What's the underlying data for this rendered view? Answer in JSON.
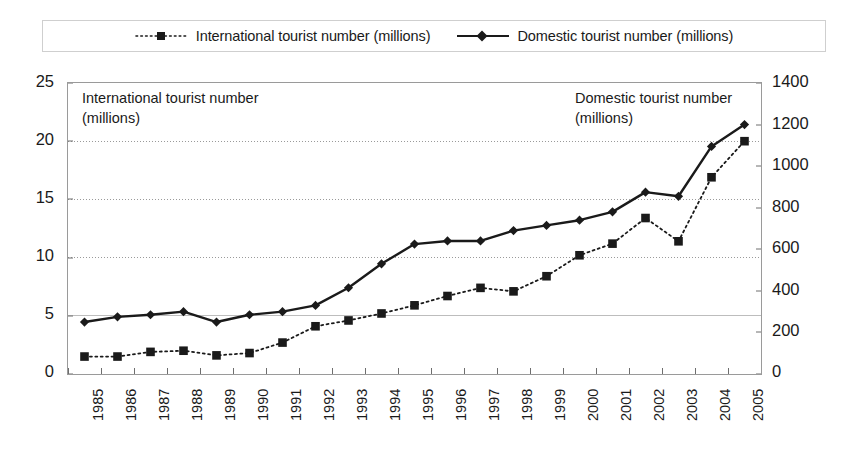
{
  "legend": {
    "entries": [
      {
        "label": "International tourist number (millions)",
        "marker": "square-marker",
        "line": "dotted",
        "color": "#1a1a1a"
      },
      {
        "label": "Domestic tourist number (millions)",
        "marker": "diamond-marker",
        "line": "solid",
        "color": "#1a1a1a"
      }
    ]
  },
  "annotations": {
    "international": "International tourist number\n(millions)",
    "domestic": "Domestic tourist number\n(millions)"
  },
  "axes": {
    "left_ticks": [
      "25",
      "20",
      "15",
      "10",
      "5",
      "0"
    ],
    "right_ticks": [
      "1400",
      "1200",
      "1000",
      "800",
      "600",
      "400",
      "200",
      "0"
    ]
  },
  "chart_data": {
    "type": "line",
    "title": "",
    "xlabel": "",
    "ylabel": "",
    "y2label": "",
    "grid": true,
    "legend_position": "top",
    "categories": [
      "1985",
      "1986",
      "1987",
      "1988",
      "1989",
      "1990",
      "1991",
      "1992",
      "1993",
      "1994",
      "1995",
      "1996",
      "1997",
      "1998",
      "1999",
      "2000",
      "2001",
      "2002",
      "2003",
      "2004",
      "2005"
    ],
    "ylim": [
      0,
      25
    ],
    "yticks": [
      0,
      5,
      10,
      15,
      20,
      25
    ],
    "y2lim": [
      0,
      1400
    ],
    "y2ticks": [
      0,
      200,
      400,
      600,
      800,
      1000,
      1200,
      1400
    ],
    "series": [
      {
        "name": "International tourist number (millions)",
        "axis": "left",
        "marker": "square",
        "linestyle": "dotted",
        "color": "#1a1a1a",
        "values": [
          1.5,
          1.5,
          1.9,
          2.0,
          1.6,
          1.8,
          2.7,
          4.1,
          4.6,
          5.2,
          5.9,
          6.7,
          7.4,
          7.1,
          8.4,
          10.2,
          11.2,
          13.4,
          11.4,
          16.9,
          20.0
        ]
      },
      {
        "name": "Domestic tourist number (millions)",
        "axis": "right",
        "marker": "diamond",
        "linestyle": "solid",
        "color": "#1a1a1a",
        "values": [
          250,
          275,
          285,
          300,
          250,
          285,
          300,
          330,
          415,
          530,
          625,
          640,
          640,
          690,
          715,
          740,
          780,
          875,
          855,
          1095,
          1200
        ]
      }
    ]
  }
}
